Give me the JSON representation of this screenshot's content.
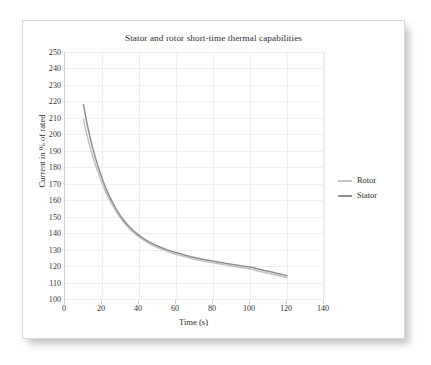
{
  "figure": {
    "title": "Stator and rotor short-time thermal capabilities",
    "background_color": "#ffffff",
    "border_color": "#d8d8d8"
  },
  "axes": {
    "x_title": "Time (s)",
    "y_title": "Current in % of rated",
    "x_ticks": [
      "0",
      "20",
      "40",
      "60",
      "80",
      "100",
      "120",
      "140"
    ],
    "y_ticks": [
      "250",
      "240",
      "230",
      "220",
      "210",
      "200",
      "190",
      "180",
      "170",
      "160",
      "150",
      "140",
      "130",
      "120",
      "110",
      "100"
    ]
  },
  "legend": {
    "items": [
      {
        "label": "Rotor",
        "color": "#c2c2c2"
      },
      {
        "label": "Stator",
        "color": "#8f8f8f"
      }
    ]
  },
  "chart_data": {
    "type": "line",
    "title": "Stator and rotor short-time thermal capabilities",
    "xlabel": "Time (s)",
    "ylabel": "Current in % of rated",
    "xlim": [
      0,
      140
    ],
    "ylim": [
      100,
      250
    ],
    "xticks": [
      0,
      20,
      40,
      60,
      80,
      100,
      120,
      140
    ],
    "yticks": [
      100,
      110,
      120,
      130,
      140,
      150,
      160,
      170,
      180,
      190,
      200,
      210,
      220,
      230,
      240,
      250
    ],
    "grid": true,
    "legend_position": "right",
    "series": [
      {
        "name": "Stator",
        "color": "#8f8f8f",
        "x": [
          10,
          12,
          14,
          16,
          18,
          20,
          22,
          24,
          26,
          28,
          30,
          32,
          34,
          36,
          38,
          40,
          45,
          50,
          55,
          60,
          65,
          70,
          75,
          80,
          85,
          90,
          95,
          100,
          105,
          110,
          115,
          120
        ],
        "y": [
          218.0,
          206.0,
          196.0,
          187.5,
          180.0,
          173.5,
          167.5,
          162.5,
          158.0,
          154.0,
          150.5,
          147.5,
          144.8,
          142.5,
          140.5,
          138.7,
          135.0,
          132.2,
          130.0,
          128.2,
          126.6,
          125.2,
          124.0,
          123.0,
          122.0,
          121.1,
          120.2,
          119.4,
          118.1,
          116.8,
          115.5,
          114.2
        ]
      },
      {
        "name": "Rotor",
        "color": "#c2c2c2",
        "x": [
          10,
          12,
          14,
          16,
          18,
          20,
          22,
          24,
          26,
          28,
          30,
          32,
          34,
          36,
          38,
          40,
          45,
          50,
          55,
          60,
          65,
          70,
          75,
          80,
          85,
          90,
          95,
          100,
          105,
          110,
          115,
          120
        ],
        "y": [
          209.0,
          199.0,
          190.5,
          183.0,
          176.5,
          170.5,
          165.2,
          160.5,
          156.3,
          152.5,
          149.2,
          146.3,
          143.8,
          141.5,
          139.5,
          137.7,
          134.0,
          131.2,
          129.0,
          127.2,
          125.6,
          124.2,
          123.0,
          122.0,
          121.0,
          120.0,
          119.1,
          118.2,
          116.9,
          115.6,
          114.3,
          113.0
        ]
      }
    ]
  }
}
